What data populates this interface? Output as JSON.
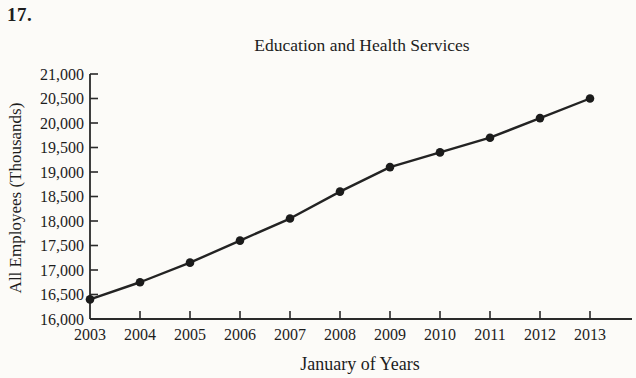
{
  "page": {
    "problem_number": "17."
  },
  "chart_data": {
    "type": "line",
    "title": "Education and Health Services",
    "xlabel": "January of Years",
    "ylabel": "All Employees (Thousands)",
    "x": [
      2003,
      2004,
      2005,
      2006,
      2007,
      2008,
      2009,
      2010,
      2011,
      2012,
      2013
    ],
    "series": [
      {
        "name": "All Employees (Thousands)",
        "values": [
          16400,
          16750,
          17150,
          17600,
          18050,
          18600,
          19100,
          19400,
          19700,
          20100,
          20500
        ]
      }
    ],
    "ylim": [
      16000,
      21000
    ],
    "ytick_step": 500,
    "grid": false,
    "legend": "none",
    "marker": "circle",
    "line_color": "#232323",
    "marker_color": "#1b1b1b",
    "axis_color": "#2a2a2a",
    "text_color": "#1d1d1d",
    "background_color": "#fcfbf8"
  }
}
